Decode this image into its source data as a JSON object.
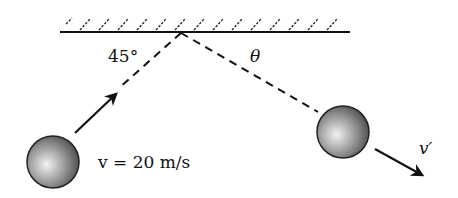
{
  "diagram": {
    "wall": {
      "label": "wall",
      "hatch": true
    },
    "incoming": {
      "angle_label": "45°",
      "velocity_label": "v = 20 m/s"
    },
    "outgoing": {
      "angle_label": "θ",
      "velocity_label": "v′"
    },
    "colors": {
      "ink": "#111111",
      "ball_light": "#e8e8e8",
      "ball_dark": "#555555"
    }
  }
}
